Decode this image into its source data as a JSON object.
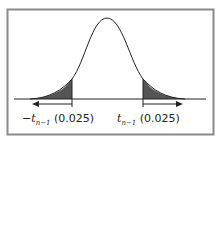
{
  "diagram": {
    "type": "t-distribution two-tailed critical region",
    "left_label": {
      "sign": "−",
      "var": "t",
      "sub": "n−1",
      "value": "(0.025)"
    },
    "right_label": {
      "sign": "",
      "var": "t",
      "sub": "n−1",
      "value": "(0.025)"
    },
    "colors": {
      "frame": "#8a8a8a",
      "shade": "#555555",
      "curve": "#222222"
    }
  }
}
